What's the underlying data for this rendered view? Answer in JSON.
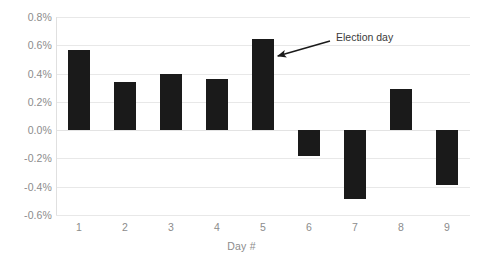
{
  "chart_data": {
    "type": "bar",
    "title": "",
    "subtitle": "",
    "xlabel": "Day #",
    "ylabel": "",
    "categories": [
      "1",
      "2",
      "3",
      "4",
      "5",
      "6",
      "7",
      "8",
      "9"
    ],
    "values": [
      0.57,
      0.34,
      0.395,
      0.365,
      0.645,
      -0.185,
      -0.485,
      0.29,
      -0.39
    ],
    "value_unit": "%",
    "ylim": [
      -0.6,
      0.8
    ],
    "ytick_values": [
      0.8,
      0.6,
      0.4,
      0.2,
      0.0,
      -0.2,
      -0.4,
      -0.6
    ],
    "ytick_labels": [
      "0.8%",
      "0.6%",
      "0.4%",
      "0.2%",
      "0.0%",
      "-0.2%",
      "-0.4%",
      "-0.6%"
    ],
    "grid": true,
    "legend": null,
    "legend_position": "none",
    "series": [
      {
        "name": "Daily change",
        "values": [
          0.57,
          0.34,
          0.395,
          0.365,
          0.645,
          -0.185,
          -0.485,
          0.29,
          -0.39
        ],
        "color": "#1a1a1a"
      }
    ],
    "annotations": [
      {
        "text": "Election day",
        "points_to_category": "5",
        "text_x": 336,
        "text_y": 31,
        "arrow_tail_x": 330,
        "arrow_tail_y": 41,
        "arrow_tip_x": 271,
        "arrow_tip_y": 58
      }
    ]
  },
  "colors": {
    "bar": "#1a1a1a",
    "gridline": "#e8e8e8",
    "tick_text": "#8c8c8c",
    "annotation_text": "#3b3b3b",
    "background": "#ffffff"
  }
}
